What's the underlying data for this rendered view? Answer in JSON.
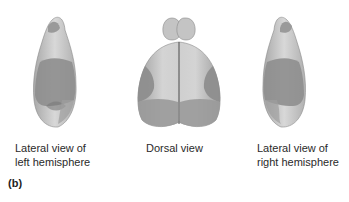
{
  "figure": {
    "panel_label": "(b)",
    "views": [
      {
        "id": "left-lateral",
        "caption_line1": "Lateral view of",
        "caption_line2": "left hemisphere"
      },
      {
        "id": "dorsal",
        "caption_line1": "Dorsal view",
        "caption_line2": ""
      },
      {
        "id": "right-lateral",
        "caption_line1": "Lateral view of",
        "caption_line2": "right hemisphere"
      }
    ],
    "colors": {
      "surface_light": "#d2d2d2",
      "surface_mid": "#b4b4b4",
      "region_shade": "#8e8e8e",
      "region_dark": "#7a7a7a",
      "outline": "#6a6a6a"
    }
  }
}
